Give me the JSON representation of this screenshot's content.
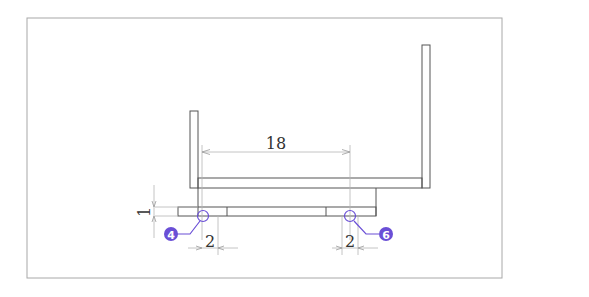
{
  "drawing": {
    "colors": {
      "outline": "#555555",
      "frame": "#a8a8a8",
      "dim_line": "#b5b5b5",
      "dim_text": "#333333",
      "callout": "#6a4fd6",
      "callout_text": "#ffffff"
    },
    "dimensions": {
      "center_span": "18",
      "left_hole_width": "2",
      "right_hole_width": "2",
      "strip_height": "1"
    },
    "callouts": [
      {
        "id": "4",
        "label": "4"
      },
      {
        "id": "6",
        "label": "6"
      }
    ]
  }
}
